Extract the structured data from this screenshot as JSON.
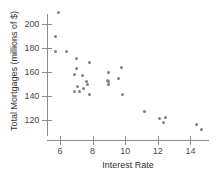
{
  "chart_data": {
    "type": "scatter",
    "title": "",
    "xlabel": "Interest Rate",
    "ylabel": "Total Mortgages (millions of $)",
    "xlim": [
      5.2,
      15.0
    ],
    "ylim": [
      108,
      215
    ],
    "grid": false,
    "legend": null,
    "xticks": [
      6,
      8,
      10,
      12,
      14
    ],
    "yticks": [
      120,
      140,
      160,
      180,
      200
    ],
    "xtick_labels": [
      "6",
      "8",
      "10",
      "12",
      "14"
    ],
    "ytick_labels": [
      "120",
      "140",
      "160",
      "180",
      "200"
    ],
    "marker": {
      "shape": "circle",
      "color": "#808080",
      "size_px": 3
    },
    "points": [
      {
        "x": 5.9,
        "y": 210
      },
      {
        "x": 5.7,
        "y": 190
      },
      {
        "x": 5.7,
        "y": 177
      },
      {
        "x": 6.4,
        "y": 177
      },
      {
        "x": 7.0,
        "y": 171
      },
      {
        "x": 7.8,
        "y": 168
      },
      {
        "x": 9.8,
        "y": 164
      },
      {
        "x": 7.0,
        "y": 163
      },
      {
        "x": 9.0,
        "y": 160
      },
      {
        "x": 6.9,
        "y": 158
      },
      {
        "x": 7.4,
        "y": 157
      },
      {
        "x": 9.6,
        "y": 155
      },
      {
        "x": 8.9,
        "y": 153
      },
      {
        "x": 9.0,
        "y": 152
      },
      {
        "x": 7.6,
        "y": 152
      },
      {
        "x": 7.7,
        "y": 150
      },
      {
        "x": 8.95,
        "y": 150
      },
      {
        "x": 7.1,
        "y": 148
      },
      {
        "x": 7.45,
        "y": 146
      },
      {
        "x": 6.9,
        "y": 144
      },
      {
        "x": 7.2,
        "y": 144
      },
      {
        "x": 7.8,
        "y": 141
      },
      {
        "x": 9.85,
        "y": 141
      },
      {
        "x": 11.2,
        "y": 127
      },
      {
        "x": 12.1,
        "y": 121
      },
      {
        "x": 12.5,
        "y": 122
      },
      {
        "x": 12.35,
        "y": 118
      },
      {
        "x": 14.4,
        "y": 116
      },
      {
        "x": 14.7,
        "y": 112
      }
    ]
  }
}
